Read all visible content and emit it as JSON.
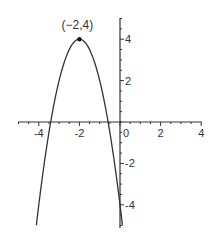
{
  "chart_data": {
    "type": "line",
    "title": "",
    "function": "y = -2(x+2)^2 + 4",
    "xlabel": "",
    "ylabel": "",
    "xlim": [
      -5,
      4
    ],
    "ylim": [
      -5,
      5
    ],
    "grid": false,
    "x_ticks": [
      -4,
      -2,
      0,
      2,
      4
    ],
    "y_ticks": [
      -4,
      -2,
      2,
      4
    ],
    "x_tick_labels": [
      "-4",
      "-2",
      "0",
      "2",
      "4"
    ],
    "y_tick_labels": [
      "-4",
      "-2",
      "2",
      "4"
    ],
    "series": [
      {
        "name": "parabola",
        "x": [
          -4.12,
          -4,
          -3.5,
          -3.41,
          -3,
          -2.5,
          -2,
          -1.5,
          -1,
          -0.59,
          -0.5,
          0,
          0.12
        ],
        "y": [
          -5,
          -4,
          -0.5,
          0,
          2,
          3.5,
          4,
          3.5,
          2,
          0,
          -0.5,
          -4,
          -5
        ]
      }
    ],
    "annotations": [
      {
        "text": "(−2,4)",
        "x": -2,
        "y": 4,
        "marker": "dot"
      }
    ],
    "colors": {
      "curve": "#333333",
      "axis": "#333333",
      "background": "#ffffff"
    }
  }
}
